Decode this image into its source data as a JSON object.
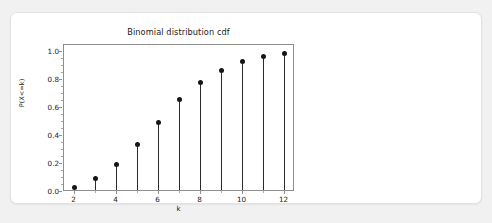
{
  "card": {
    "background_color": "#ffffff",
    "border_color": "#e2e2e2"
  },
  "page": {
    "background_color": "#f1f1f1"
  },
  "chart_data": {
    "type": "scatter",
    "subtype": "stem",
    "title": "Binomial distribution cdf",
    "xlabel": "k",
    "ylabel": "P(X<=k)",
    "x": [
      2,
      3,
      4,
      5,
      6,
      7,
      8,
      9,
      10,
      11,
      12
    ],
    "values": [
      0.03,
      0.1,
      0.2,
      0.34,
      0.5,
      0.66,
      0.78,
      0.87,
      0.93,
      0.97,
      0.99
    ],
    "xlim": [
      1.5,
      12.5
    ],
    "ylim": [
      0.0,
      1.05
    ],
    "xticks": [
      2,
      4,
      6,
      8,
      10,
      12
    ],
    "xtick_labels": [
      "2",
      "4",
      "6",
      "8",
      "10",
      "12"
    ],
    "yticks": [
      0.0,
      0.2,
      0.4,
      0.6,
      0.8,
      1.0
    ],
    "ytick_labels": [
      "0.0",
      "0.2",
      "0.4",
      "0.6",
      "0.8",
      "1.0"
    ],
    "grid": false,
    "legend": null,
    "marker_color": "#161616",
    "stem_color": "#2b2b2b",
    "axis_color": "#8e8e8e"
  }
}
